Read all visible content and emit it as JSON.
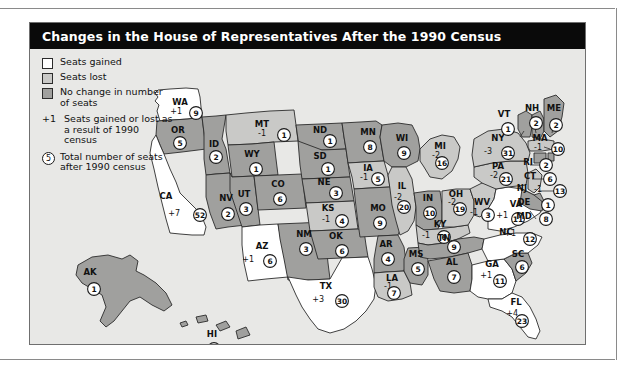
{
  "title": "Changes in the House of Representatives After the 1990 Census",
  "legend": {
    "swatches": [
      {
        "key": "gained",
        "label": "Seats gained"
      },
      {
        "key": "lost",
        "label": "Seats lost"
      },
      {
        "key": "same",
        "label": "No change in number of seats"
      }
    ],
    "note_change": {
      "symbol": "+1",
      "text": "Seats gained or lost as a result of 1990 census"
    },
    "note_total": {
      "symbol": "5",
      "text": "Total number of seats after 1990 census"
    }
  },
  "chart_data": {
    "type": "map",
    "title": "Changes in the House of Representatives After the 1990 Census",
    "legend_categories": [
      "Seats gained",
      "Seats lost",
      "No change in number of seats"
    ],
    "value_fields": [
      "change",
      "total_seats"
    ],
    "states": [
      {
        "code": "WA",
        "change": "+1",
        "total": "9",
        "status": "gained"
      },
      {
        "code": "OR",
        "change": "",
        "total": "5",
        "status": "same"
      },
      {
        "code": "CA",
        "change": "+7",
        "total": "52",
        "status": "gained"
      },
      {
        "code": "ID",
        "change": "",
        "total": "2",
        "status": "same"
      },
      {
        "code": "NV",
        "change": "",
        "total": "2",
        "status": "same"
      },
      {
        "code": "MT",
        "change": "-1",
        "total": "1",
        "status": "lost"
      },
      {
        "code": "WY",
        "change": "",
        "total": "1",
        "status": "same"
      },
      {
        "code": "UT",
        "change": "",
        "total": "3",
        "status": "same"
      },
      {
        "code": "AZ",
        "change": "+1",
        "total": "6",
        "status": "gained"
      },
      {
        "code": "CO",
        "change": "",
        "total": "6",
        "status": "same"
      },
      {
        "code": "NM",
        "change": "",
        "total": "3",
        "status": "same"
      },
      {
        "code": "ND",
        "change": "",
        "total": "1",
        "status": "same"
      },
      {
        "code": "SD",
        "change": "",
        "total": "1",
        "status": "same"
      },
      {
        "code": "NE",
        "change": "",
        "total": "3",
        "status": "same"
      },
      {
        "code": "KS",
        "change": "-1",
        "total": "4",
        "status": "lost"
      },
      {
        "code": "OK",
        "change": "",
        "total": "6",
        "status": "same"
      },
      {
        "code": "TX",
        "change": "+3",
        "total": "30",
        "status": "gained"
      },
      {
        "code": "MN",
        "change": "",
        "total": "8",
        "status": "same"
      },
      {
        "code": "IA",
        "change": "-1",
        "total": "5",
        "status": "lost"
      },
      {
        "code": "MO",
        "change": "",
        "total": "9",
        "status": "same"
      },
      {
        "code": "AR",
        "change": "",
        "total": "4",
        "status": "same"
      },
      {
        "code": "LA",
        "change": "-1",
        "total": "7",
        "status": "lost"
      },
      {
        "code": "WI",
        "change": "",
        "total": "9",
        "status": "same"
      },
      {
        "code": "IL",
        "change": "-2",
        "total": "20",
        "status": "lost"
      },
      {
        "code": "MS",
        "change": "",
        "total": "5",
        "status": "same"
      },
      {
        "code": "MI",
        "change": "-2",
        "total": "16",
        "status": "lost"
      },
      {
        "code": "IN",
        "change": "",
        "total": "10",
        "status": "same"
      },
      {
        "code": "KY",
        "change": "-1",
        "total": "6",
        "status": "lost"
      },
      {
        "code": "TN",
        "change": "",
        "total": "9",
        "status": "same"
      },
      {
        "code": "AL",
        "change": "",
        "total": "7",
        "status": "same"
      },
      {
        "code": "OH",
        "change": "-2",
        "total": "19",
        "status": "lost"
      },
      {
        "code": "WV",
        "change": "-1",
        "total": "3",
        "status": "lost"
      },
      {
        "code": "GA",
        "change": "+1",
        "total": "11",
        "status": "gained"
      },
      {
        "code": "FL",
        "change": "+4",
        "total": "23",
        "status": "gained"
      },
      {
        "code": "SC",
        "change": "",
        "total": "6",
        "status": "same"
      },
      {
        "code": "NC",
        "change": "+1",
        "total": "12",
        "status": "gained"
      },
      {
        "code": "VA",
        "change": "+1",
        "total": "11",
        "status": "gained"
      },
      {
        "code": "PA",
        "change": "-2",
        "total": "21",
        "status": "lost"
      },
      {
        "code": "NY",
        "change": "-3",
        "total": "31",
        "status": "lost"
      },
      {
        "code": "VT",
        "change": "",
        "total": "1",
        "status": "same"
      },
      {
        "code": "NH",
        "change": "",
        "total": "2",
        "status": "same"
      },
      {
        "code": "ME",
        "change": "",
        "total": "2",
        "status": "same"
      },
      {
        "code": "MA",
        "change": "-1",
        "total": "10",
        "status": "lost"
      },
      {
        "code": "RI",
        "change": "",
        "total": "2",
        "status": "same"
      },
      {
        "code": "CT",
        "change": "",
        "total": "6",
        "status": "same"
      },
      {
        "code": "NJ",
        "change": "-1",
        "total": "13",
        "status": "lost"
      },
      {
        "code": "DE",
        "change": "",
        "total": "1",
        "status": "same"
      },
      {
        "code": "MD",
        "change": "",
        "total": "8",
        "status": "same"
      },
      {
        "code": "AK",
        "change": "",
        "total": "1",
        "status": "same"
      },
      {
        "code": "HI",
        "change": "",
        "total": "2",
        "status": "same"
      }
    ]
  },
  "colors": {
    "gained": "#ffffff",
    "lost": "#c9c9c7",
    "same": "#a0a09e",
    "background": "#e8e8e6",
    "title_bar": "#0a0a0a",
    "stroke": "#2b2b2b"
  }
}
